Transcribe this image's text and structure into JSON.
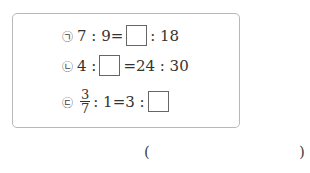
{
  "problem": {
    "items": [
      {
        "marker": "㉠",
        "left": "7 : 9=",
        "right": ": 18"
      },
      {
        "marker": "㉡",
        "left": "4 :",
        "right": "=24 : 30"
      },
      {
        "marker": "㉢",
        "frac_num": "3",
        "frac_den": "7",
        "right_pre": ": 1=3 :"
      }
    ],
    "answer_open": "(",
    "answer_close": ")"
  }
}
